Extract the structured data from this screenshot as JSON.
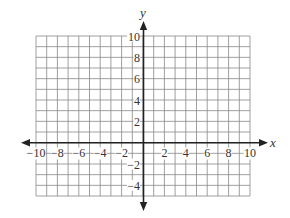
{
  "chart_data": {
    "type": "coordinate-grid",
    "title": "",
    "xlabel": "x",
    "ylabel": "y",
    "xlim": [
      -10,
      10
    ],
    "ylim": [
      -5,
      10
    ],
    "grid": true,
    "grid_step": 1,
    "x_ticks": [
      -10,
      -8,
      -6,
      -4,
      -2,
      2,
      4,
      6,
      8,
      10
    ],
    "y_ticks": [
      10,
      8,
      6,
      4,
      2,
      -2,
      -4
    ],
    "x_tick_labels": [
      "−10",
      "−8",
      "−6",
      "−4",
      "−2",
      "2",
      "4",
      "6",
      "8",
      "10"
    ],
    "y_tick_labels": [
      "10",
      "8",
      "6",
      "4",
      "2",
      "−2",
      "−4"
    ],
    "series": [],
    "colors": {
      "grid": "#888888",
      "axis": "#222222",
      "text": "#333333"
    }
  }
}
